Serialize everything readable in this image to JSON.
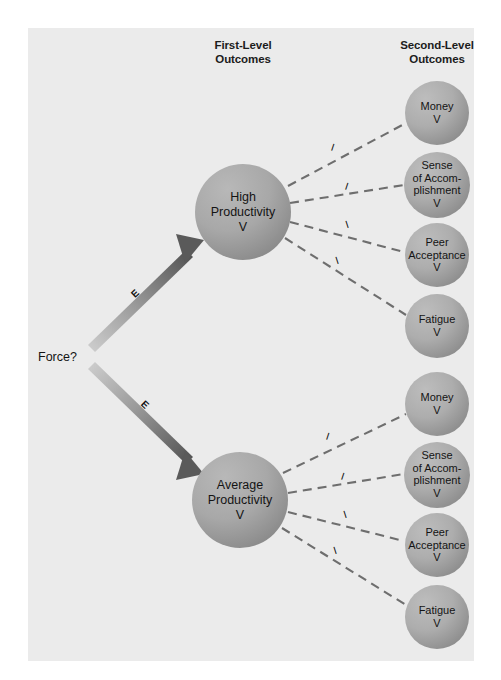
{
  "page": {
    "background": "#ffffff",
    "panel_color": "#ebebeb"
  },
  "headers": {
    "first_level": "First-Level\nOutcomes",
    "first_level_line1": "First-Level",
    "first_level_line2": "Outcomes",
    "second_level_line1": "Second-Level",
    "second_level_line2": "Outcomes"
  },
  "source": {
    "label": "Force?"
  },
  "arrows": [
    {
      "name": "expectancy-high",
      "label": "E",
      "from": "Force?",
      "to": "High Productivity"
    },
    {
      "name": "expectancy-average",
      "label": "E",
      "from": "Force?",
      "to": "Average Productivity"
    }
  ],
  "first_level": [
    {
      "id": "high-productivity",
      "line1": "High",
      "line2": "Productivity",
      "line3": "V",
      "color": "#a0a0a0"
    },
    {
      "id": "average-productivity",
      "line1": "Average",
      "line2": "Productivity",
      "line3": "V",
      "color": "#a0a0a0"
    }
  ],
  "second_level_top": [
    {
      "id": "money-top",
      "lines": [
        "Money",
        "V"
      ],
      "color": "#a8a8a8"
    },
    {
      "id": "accomplishment-top",
      "lines": [
        "Sense",
        "of Accom-",
        "plishment",
        "V"
      ],
      "color": "#a8a8a8"
    },
    {
      "id": "peer-acceptance-top",
      "lines": [
        "Peer",
        "Acceptance",
        "V"
      ],
      "color": "#a8a8a8"
    },
    {
      "id": "fatigue-top",
      "lines": [
        "Fatigue",
        "V"
      ],
      "color": "#a8a8a8"
    }
  ],
  "second_level_bottom": [
    {
      "id": "money-bottom",
      "lines": [
        "Money",
        "V"
      ],
      "color": "#a8a8a8"
    },
    {
      "id": "accomplishment-bottom",
      "lines": [
        "Sense",
        "of Accom-",
        "plishment",
        "V"
      ],
      "color": "#a8a8a8"
    },
    {
      "id": "peer-acceptance-bottom",
      "lines": [
        "Peer",
        "Acceptance",
        "V"
      ],
      "color": "#a8a8a8"
    },
    {
      "id": "fatigue-bottom",
      "lines": [
        "Fatigue",
        "V"
      ],
      "color": "#a8a8a8"
    }
  ],
  "instrumentality_labels": {
    "letter": "I",
    "count_top": 4,
    "count_bottom": 4
  },
  "colors": {
    "circle_light": "#b3b3b3",
    "circle_dark": "#949494",
    "arrow_tail": "#c8c8c8",
    "arrow_head": "#5a5a5a",
    "dashed_line": "#6e6e6e",
    "text": "#141414"
  }
}
